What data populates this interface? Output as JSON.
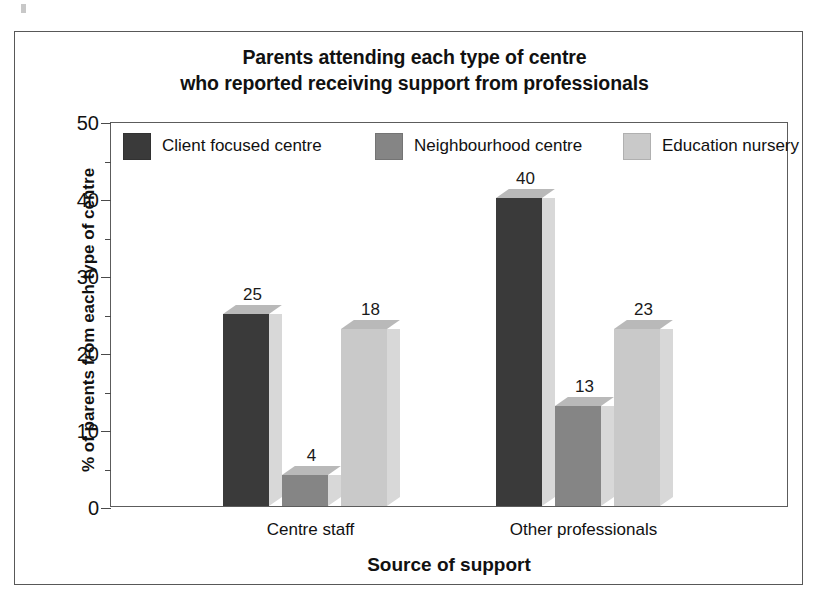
{
  "figure": {
    "title_line1": "Parents attending each type of centre",
    "title_line2": "who reported receiving support from professionals"
  },
  "chart_data": {
    "type": "bar",
    "title": "Parents attending each type of centre who reported receiving support from professionals",
    "xlabel": "Source of support",
    "ylabel": "% of parents from each type of centre",
    "categories": [
      "Centre staff",
      "Other professionals"
    ],
    "series": [
      {
        "name": "Client focused centre",
        "values": [
          25,
          40
        ],
        "color": "#3a3a3a"
      },
      {
        "name": "Neighbourhood centre",
        "values": [
          4,
          13
        ],
        "color": "#858585"
      },
      {
        "name": "Education nursery",
        "values": [
          23,
          23
        ],
        "color": "#c9c9c9"
      }
    ],
    "ylim": [
      0,
      50
    ],
    "yticks": [
      0,
      10,
      20,
      30,
      40,
      50
    ],
    "yticks_minor": [
      5,
      15,
      25,
      35,
      45
    ],
    "ytick_labels": [
      "0",
      "10",
      "20",
      "30",
      "40",
      "50"
    ],
    "grid": false,
    "legend_position": "top-inside",
    "value_labels": [
      [
        "25",
        "4",
        "18"
      ],
      [
        "40",
        "13",
        "23"
      ]
    ]
  },
  "legend": {
    "entries": [
      {
        "label": "Client focused centre",
        "color": "#3a3a3a"
      },
      {
        "label": "Neighbourhood centre",
        "color": "#858585"
      },
      {
        "label": "Education nursery",
        "color": "#c9c9c9"
      }
    ]
  },
  "colors": {
    "dark": "#3a3a3a",
    "medium": "#858585",
    "light": "#c9c9c9",
    "top_face": "#b9b9b9",
    "side_face": "#d8d8d8",
    "frame": "#5c5c5c",
    "text": "#111111"
  }
}
